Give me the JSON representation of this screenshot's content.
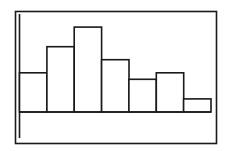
{
  "chart_data": {
    "type": "bar",
    "style": "histogram",
    "title": "",
    "xlabel": "",
    "ylabel": "",
    "categories": [
      "1",
      "2",
      "3",
      "4",
      "5",
      "6",
      "7"
    ],
    "values": [
      6,
      10,
      13,
      8,
      5,
      6,
      2
    ],
    "ylim": [
      -4,
      15
    ],
    "grid": false,
    "legend": "none",
    "colors": {
      "stroke": "#1a1a1a",
      "fill": "#ffffff",
      "background": "#ffffff"
    }
  }
}
